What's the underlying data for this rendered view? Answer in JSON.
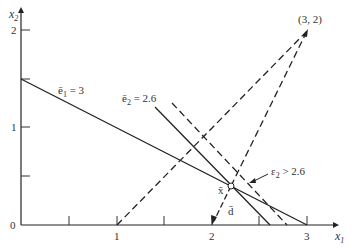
{
  "diagram": {
    "axes": {
      "x_label": "x",
      "x_label_sub": "1",
      "y_label": "x",
      "y_label_sub": "2",
      "x_ticks": [
        "1",
        "2",
        "3"
      ],
      "y_ticks": [
        "0",
        "1",
        "2"
      ],
      "x_range": [
        0,
        3.2
      ],
      "y_range": [
        0,
        2.1
      ]
    },
    "lines": [
      {
        "name": "e1-constraint",
        "label": "ē₁ = 3",
        "style": "solid",
        "from": [
          0,
          1.5
        ],
        "to": [
          3,
          0
        ]
      },
      {
        "name": "e2-constraint",
        "label": "ē₂ = 2.6",
        "style": "solid",
        "from": [
          1.4,
          1.21
        ],
        "to": [
          2.6,
          0
        ]
      },
      {
        "name": "e2-greater",
        "label": "ε₂ > 2.6",
        "style": "dashed",
        "from": [
          1.57,
          1.25
        ],
        "to": [
          2.78,
          0
        ]
      },
      {
        "name": "cone-left",
        "style": "dashed",
        "from": [
          1,
          0
        ],
        "to": [
          3,
          2
        ]
      },
      {
        "name": "cone-right",
        "style": "dashed",
        "from": [
          2.2,
          0.4
        ],
        "to": [
          3,
          2
        ]
      }
    ],
    "points": [
      {
        "name": "apex",
        "label": "(3, 2)",
        "at": [
          3,
          2
        ]
      },
      {
        "name": "x-bar",
        "label": "x̄",
        "at": [
          2.2,
          0.4
        ]
      }
    ],
    "direction": {
      "label": "d̄",
      "from": [
        2.2,
        0.4
      ],
      "to": [
        2.0,
        0
      ]
    },
    "labels": {
      "e1": "ē",
      "e1_sub": "1",
      "e1_eq": " = 3",
      "e2": "ē",
      "e2_sub": "2",
      "e2_eq": " = 2.6",
      "eps2": "ε",
      "eps2_sub": "2",
      "eps2_eq": " > 2.6",
      "apex": "(3, 2)",
      "xbar": "x̄",
      "dbar": "d̄"
    }
  }
}
